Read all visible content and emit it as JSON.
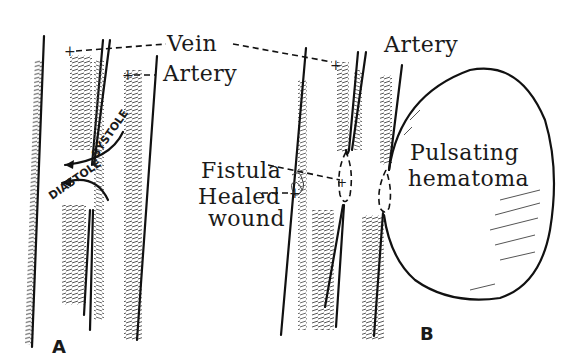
{
  "figure": {
    "panels": [
      {
        "id": "A",
        "label": "A",
        "annotations": {
          "vein": "Vein",
          "artery": "Artery",
          "systole": "SYSTOLE",
          "diastole": "DIASTOLE"
        }
      },
      {
        "id": "B",
        "label": "B",
        "annotations": {
          "artery": "Artery",
          "fistula": "Fistula",
          "healed_line1": "Healed",
          "healed_line2": "wound",
          "hematoma_line1": "Pulsating",
          "hematoma_line2": "hematoma"
        }
      }
    ],
    "markers": {
      "plus": "+"
    },
    "colors": {
      "ink": "#111111",
      "background": "#ffffff"
    }
  }
}
